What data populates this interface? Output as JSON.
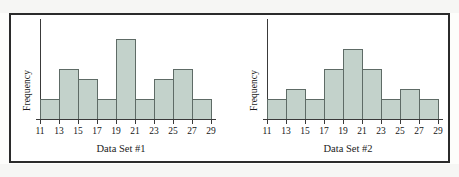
{
  "figure": {
    "caption": "",
    "panel_count": 2,
    "bar_fill_color": "#c3d2cb",
    "bar_edge_color": "#5e6b66",
    "axis_color": "#3a3a3a",
    "frame_color": "#2b2b2b"
  },
  "chart_data": [
    {
      "type": "bar",
      "title": "",
      "xlabel": "Data Set #1",
      "ylabel": "Frequency",
      "categories": [
        "11",
        "13",
        "15",
        "17",
        "19",
        "21",
        "23",
        "25",
        "27",
        "29"
      ],
      "tick_labels": [
        "11",
        "13",
        "15",
        "17",
        "19",
        "21",
        "23",
        "25",
        "27",
        "29"
      ],
      "bin_edges": [
        11,
        13,
        15,
        17,
        19,
        21,
        23,
        25,
        27,
        29
      ],
      "bin_labels": [
        "11-13",
        "13-15",
        "15-17",
        "17-19",
        "19-21",
        "21-23",
        "23-25",
        "25-27",
        "27-29"
      ],
      "values": [
        2,
        5,
        4,
        2,
        8,
        2,
        4,
        5,
        2
      ],
      "ylim": [
        0,
        10
      ],
      "xlim": [
        11,
        29
      ],
      "grid": false,
      "legend": false
    },
    {
      "type": "bar",
      "title": "",
      "xlabel": "Data Set #2",
      "ylabel": "Frequency",
      "categories": [
        "11",
        "13",
        "15",
        "17",
        "19",
        "21",
        "23",
        "25",
        "27",
        "29"
      ],
      "tick_labels": [
        "11",
        "13",
        "15",
        "17",
        "19",
        "21",
        "23",
        "25",
        "27",
        "29"
      ],
      "bin_edges": [
        11,
        13,
        15,
        17,
        19,
        21,
        23,
        25,
        27,
        29
      ],
      "bin_labels": [
        "11-13",
        "13-15",
        "15-17",
        "17-19",
        "19-21",
        "21-23",
        "23-25",
        "25-27",
        "27-29"
      ],
      "values": [
        2,
        3,
        2,
        5,
        7,
        5,
        2,
        3,
        2
      ],
      "ylim": [
        0,
        10
      ],
      "xlim": [
        11,
        29
      ],
      "grid": false,
      "legend": false
    }
  ]
}
